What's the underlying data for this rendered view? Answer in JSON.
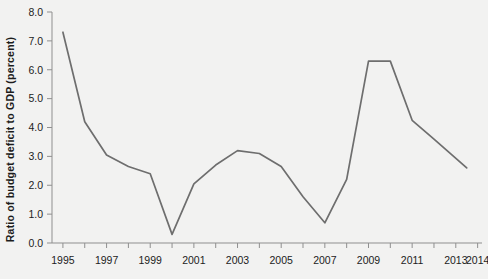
{
  "chart_data": {
    "type": "line",
    "title": "",
    "xlabel": "",
    "ylabel": "Ratio of budget deficit to GDP (percent)",
    "ylim": [
      0.0,
      8.0
    ],
    "xlim": [
      1994.5,
      2014.2
    ],
    "grid": false,
    "legend": "none",
    "line_color": "#6e6e6e",
    "background_color": "#f2f2f1",
    "axis_color": "#8f8f8f",
    "y_ticks": [
      "0.0",
      "1.0",
      "2.0",
      "3.0",
      "4.0",
      "5.0",
      "6.0",
      "7.0",
      "8.0"
    ],
    "y_tick_values": [
      0.0,
      1.0,
      2.0,
      3.0,
      4.0,
      5.0,
      6.0,
      7.0,
      8.0
    ],
    "x_tick_labels": [
      "1995",
      "1997",
      "1999",
      "2001",
      "2003",
      "2005",
      "2007",
      "2009",
      "2011",
      "2013",
      "2014"
    ],
    "x_tick_values": [
      1995,
      1997,
      1999,
      2001,
      2003,
      2005,
      2007,
      2009,
      2011,
      2013,
      2014
    ],
    "x_minor_tick_values": [
      1995,
      1996,
      1997,
      1998,
      1999,
      2000,
      2001,
      2002,
      2003,
      2004,
      2005,
      2006,
      2007,
      2008,
      2009,
      2010,
      2011,
      2012,
      2013,
      2014
    ],
    "x": [
      1995,
      1996,
      1997,
      1998,
      1999,
      2000,
      2001,
      2002,
      2003,
      2004,
      2005,
      2006,
      2007,
      2008,
      2009,
      2010,
      2011,
      2012,
      2013.5
    ],
    "values": [
      7.3,
      4.2,
      3.05,
      2.65,
      2.4,
      0.3,
      2.05,
      2.7,
      3.2,
      3.1,
      2.65,
      1.6,
      0.7,
      2.2,
      6.3,
      6.3,
      4.25,
      3.6,
      2.6
    ],
    "series": [
      {
        "name": "Ratio of budget deficit to GDP",
        "values": [
          7.3,
          4.2,
          3.05,
          2.65,
          2.4,
          0.3,
          2.05,
          2.7,
          3.2,
          3.1,
          2.65,
          1.6,
          0.7,
          2.2,
          6.3,
          6.3,
          4.25,
          3.6,
          2.6
        ]
      }
    ]
  }
}
